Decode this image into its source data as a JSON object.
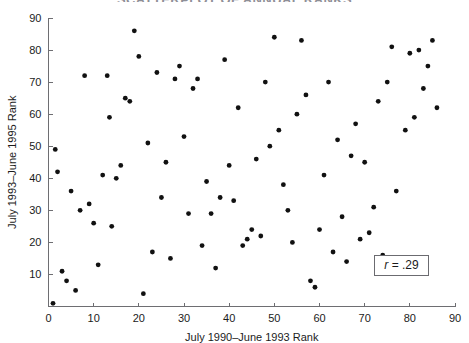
{
  "figure": {
    "title_fragment": "SCATTERPLOT OF ANNUAL RANKS",
    "width": 469,
    "height": 343,
    "background": "#ffffff",
    "point_color": "#111111",
    "axis_color": "#6e6e72"
  },
  "annotation": {
    "r_symbol": "r",
    "r_text": " = .29",
    "full_text": "r = .29"
  },
  "chart_data": {
    "type": "scatter",
    "title": "SCATTERPLOT OF ANNUAL RANKS",
    "xlabel": "July 1990–June 1993 Rank",
    "ylabel": "July 1993–June 1995 Rank",
    "xlim": [
      0,
      90
    ],
    "ylim": [
      0,
      90
    ],
    "xticks": [
      0,
      10,
      20,
      30,
      40,
      50,
      60,
      70,
      80,
      90
    ],
    "yticks": [
      10,
      20,
      30,
      40,
      50,
      60,
      70,
      80,
      90
    ],
    "xtick_labels": [
      "0",
      "10",
      "20",
      "30",
      "40",
      "50",
      "60",
      "70",
      "80",
      "90"
    ],
    "ytick_labels": [
      "10",
      "20",
      "30",
      "40",
      "50",
      "60",
      "70",
      "80",
      "90"
    ],
    "grid": false,
    "legend": null,
    "annotations": [
      {
        "text": "r = .29",
        "x": 79,
        "y": 13,
        "boxed": true
      }
    ],
    "marker": {
      "shape": "circle",
      "size": 3,
      "color": "#111111"
    },
    "correlation": 0.29,
    "n_points": 85,
    "points": [
      [
        1,
        1
      ],
      [
        1.5,
        49
      ],
      [
        2,
        42
      ],
      [
        3,
        11
      ],
      [
        4,
        8
      ],
      [
        5,
        36
      ],
      [
        6,
        5
      ],
      [
        7,
        30
      ],
      [
        8,
        72
      ],
      [
        9,
        32
      ],
      [
        10,
        26
      ],
      [
        11,
        13
      ],
      [
        12,
        41
      ],
      [
        13,
        72
      ],
      [
        13.5,
        59
      ],
      [
        14,
        25
      ],
      [
        15,
        40
      ],
      [
        16,
        44
      ],
      [
        17,
        65
      ],
      [
        18,
        64
      ],
      [
        19,
        86
      ],
      [
        20,
        78
      ],
      [
        21,
        4
      ],
      [
        22,
        51
      ],
      [
        23,
        17
      ],
      [
        24,
        73
      ],
      [
        25,
        34
      ],
      [
        26,
        45
      ],
      [
        27,
        15
      ],
      [
        28,
        71
      ],
      [
        29,
        75
      ],
      [
        30,
        53
      ],
      [
        31,
        29
      ],
      [
        32,
        68
      ],
      [
        33,
        71
      ],
      [
        34,
        19
      ],
      [
        35,
        39
      ],
      [
        36,
        29
      ],
      [
        37,
        12
      ],
      [
        38,
        34
      ],
      [
        39,
        77
      ],
      [
        40,
        44
      ],
      [
        41,
        33
      ],
      [
        42,
        62
      ],
      [
        43,
        19
      ],
      [
        44,
        21
      ],
      [
        45,
        24
      ],
      [
        46,
        46
      ],
      [
        47,
        22
      ],
      [
        48,
        70
      ],
      [
        49,
        50
      ],
      [
        50,
        84
      ],
      [
        51,
        55
      ],
      [
        52,
        38
      ],
      [
        53,
        30
      ],
      [
        54,
        20
      ],
      [
        55,
        60
      ],
      [
        56,
        83
      ],
      [
        57,
        66
      ],
      [
        58,
        8
      ],
      [
        59,
        6
      ],
      [
        60,
        24
      ],
      [
        61,
        41
      ],
      [
        62,
        70
      ],
      [
        63,
        17
      ],
      [
        64,
        52
      ],
      [
        65,
        28
      ],
      [
        66,
        14
      ],
      [
        67,
        47
      ],
      [
        68,
        57
      ],
      [
        69,
        21
      ],
      [
        70,
        45
      ],
      [
        71,
        23
      ],
      [
        72,
        31
      ],
      [
        73,
        64
      ],
      [
        74,
        16
      ],
      [
        75,
        70
      ],
      [
        76,
        81
      ],
      [
        77,
        36
      ],
      [
        79,
        55
      ],
      [
        80,
        79
      ],
      [
        81,
        59
      ],
      [
        82,
        80
      ],
      [
        83,
        68
      ],
      [
        84,
        75
      ],
      [
        85,
        83
      ],
      [
        86,
        62
      ]
    ]
  }
}
